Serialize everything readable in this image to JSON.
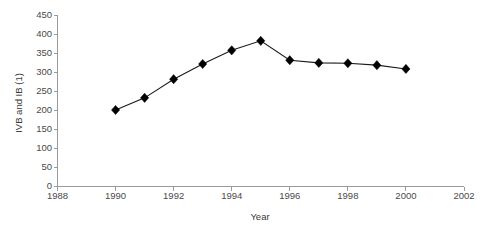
{
  "chart_data": {
    "type": "line",
    "title": "",
    "subtitle": "",
    "xlabel": "Year",
    "ylabel": "IVB and IB (1)",
    "xlim": [
      1988,
      2002
    ],
    "ylim": [
      0,
      450
    ],
    "grid": false,
    "legend": null,
    "x": [
      1990,
      1991,
      1992,
      1993,
      1994,
      1995,
      1996,
      1997,
      1998,
      1999,
      2000
    ],
    "values": [
      200,
      232,
      281,
      321,
      357,
      382,
      331,
      324,
      323,
      318,
      308
    ],
    "series": [
      {
        "name": "IVB and IB (1)",
        "marker": "diamond",
        "color": "#000000",
        "values": [
          200,
          232,
          281,
          321,
          357,
          382,
          331,
          324,
          323,
          318,
          308
        ]
      }
    ],
    "x_ticks": [
      1988,
      1990,
      1992,
      1994,
      1996,
      1998,
      2000,
      2002
    ],
    "x_tick_labels": [
      "1988",
      "1990",
      "1992",
      "1994",
      "1996",
      "1998",
      "2000",
      "2002"
    ],
    "y_ticks": [
      0,
      50,
      100,
      150,
      200,
      250,
      300,
      350,
      400,
      450
    ],
    "y_tick_labels": [
      "0",
      "50",
      "100",
      "150",
      "200",
      "250",
      "300",
      "350",
      "400",
      "450"
    ],
    "axis_color": "#9a9a9a",
    "text_color": "#3b3b3b",
    "background": "#ffffff"
  }
}
